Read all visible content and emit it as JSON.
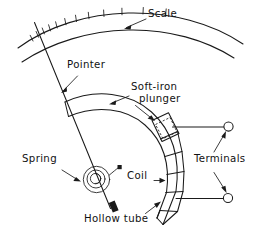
{
  "figure": {
    "background_color": "#ffffff",
    "line_color": "#1a1a1a",
    "width": 255,
    "height": 241
  },
  "labels": {
    "scale": "Scale",
    "pointer": "Pointer",
    "soft_iron_plunger_line1": "Soft-iron",
    "soft_iron_plunger_line2": "plunger",
    "terminals": "Terminals",
    "spring": "Spring",
    "coil": "Coil",
    "hollow_tube": "Hollow tube"
  },
  "parts": [
    {
      "name": "scale",
      "label": "Scale",
      "description": "Curved graduated arc at top with tick marks on outer edge",
      "tick_count": 12
    },
    {
      "name": "pointer",
      "label": "Pointer",
      "description": "Straight needle from spring pivot up to the scale"
    },
    {
      "name": "soft-iron-plunger",
      "label": "Soft-iron plunger",
      "description": "Small iron slug inside the hollow tube"
    },
    {
      "name": "coil",
      "label": "Coil",
      "description": "Winding segments around the curved hollow tube"
    },
    {
      "name": "hollow-tube",
      "label": "Hollow tube",
      "description": "Curved non-magnetic tube guiding the plunger"
    },
    {
      "name": "spring",
      "label": "Spring",
      "description": "Spiral hairspring at the pivot"
    },
    {
      "name": "terminals",
      "label": "Terminals",
      "description": "Two open-circle binding posts wired to the coil",
      "count": 2
    }
  ],
  "label_positions": {
    "scale": {
      "x": 148,
      "y": 11
    },
    "pointer": {
      "x": 67,
      "y": 62
    },
    "soft_iron_plunger": {
      "x": 131,
      "y": 84
    },
    "terminals": {
      "x": 194,
      "y": 157
    },
    "spring": {
      "x": 46,
      "y": 157
    },
    "coil": {
      "x": 127,
      "y": 174
    },
    "hollow_tube": {
      "x": 129,
      "y": 217
    }
  }
}
